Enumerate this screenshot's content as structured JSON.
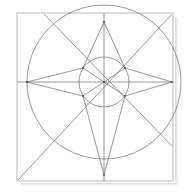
{
  "figure": {
    "canvas": {
      "width": 187,
      "height": 196,
      "background": "#ffffff"
    },
    "style": {
      "stroke_color": "#6b6b6b",
      "frame_color": "#b9b9b9",
      "stroke_width": 0.7,
      "frame_width": 1.0,
      "vertex_color": "#4a4a4a",
      "vertex_size": 1.6
    },
    "frame": {
      "name": "outer-square",
      "x": 17,
      "y": 13,
      "width": 156,
      "height": 168,
      "has_shadow": true
    },
    "center": {
      "x": 104,
      "y": 82
    },
    "circles": [
      {
        "name": "outer-circle",
        "cx": 104,
        "cy": 82,
        "r": 77
      },
      {
        "name": "inner-circle",
        "cx": 104,
        "cy": 82,
        "r": 25
      }
    ],
    "axes": [
      {
        "name": "horizontal-axis",
        "x1": 17,
        "y1": 82,
        "x2": 173,
        "y2": 82
      },
      {
        "name": "vertical-axis",
        "x1": 104,
        "y1": 13,
        "x2": 104,
        "y2": 181
      }
    ],
    "diagonals": [
      {
        "name": "diagonal-bl-tr",
        "x1": 18,
        "y1": 180,
        "x2": 172,
        "y2": 14
      },
      {
        "name": "diagonal-tl-br",
        "x1": 44,
        "y1": 14,
        "x2": 172,
        "y2": 146
      }
    ],
    "star": {
      "name": "six-pointed-star",
      "outer_points": [
        {
          "name": "star-point-top",
          "x": 104,
          "y": 22
        },
        {
          "name": "star-point-right",
          "x": 172,
          "y": 82
        },
        {
          "name": "star-point-bottom",
          "x": 104,
          "y": 175
        },
        {
          "name": "star-point-left",
          "x": 27,
          "y": 82
        }
      ],
      "inner_points": [
        {
          "name": "inner-vertex-upper-right",
          "x": 125,
          "y": 68
        },
        {
          "name": "inner-vertex-lower-right",
          "x": 125,
          "y": 96
        },
        {
          "name": "inner-vertex-lower-left",
          "x": 83,
          "y": 96
        },
        {
          "name": "inner-vertex-upper-left",
          "x": 83,
          "y": 68
        }
      ],
      "outline": "104,22 125,68 172,82 125,96 104,175 83,96 27,82 83,68",
      "spokes": [
        {
          "name": "spoke-to-upper-right",
          "x2": 125,
          "y2": 68
        },
        {
          "name": "spoke-to-lower-right",
          "x2": 125,
          "y2": 96
        },
        {
          "name": "spoke-to-lower-left",
          "x2": 83,
          "y2": 96
        },
        {
          "name": "spoke-to-upper-left",
          "x2": 83,
          "y2": 68
        }
      ]
    }
  }
}
